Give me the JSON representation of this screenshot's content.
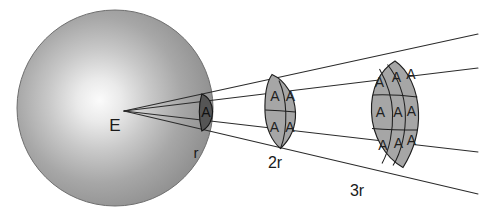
{
  "figure": {
    "background_color": "#ffffff",
    "line_color": "#2b2b2b"
  },
  "sphere": {
    "name": "energy-source-sphere",
    "label": "E",
    "center_x": 115,
    "center_y": 108,
    "radius": 98,
    "fill_center_color": "#f2f2f2",
    "fill_edge_color": "#8f8f8f",
    "outline_color": "#6e6e6e"
  },
  "apex": {
    "x": 124,
    "y": 111
  },
  "patches": [
    {
      "name": "patch-r",
      "distance_label": "r",
      "distance_label_x": 196,
      "distance_label_y": 158,
      "columns": 1,
      "rows": 1,
      "cell_label": "A",
      "cell_count": 1,
      "fill_color": "#5c5c5c",
      "stroke_color": "#1f1f1f",
      "label_color": "#111111"
    },
    {
      "name": "patch-2r",
      "distance_label": "2r",
      "distance_label_x": 275,
      "distance_label_y": 168,
      "columns": 2,
      "rows": 2,
      "cell_label": "A",
      "cell_count": 4,
      "fill_color": "#a6a6a6",
      "stroke_color": "#1f1f1f",
      "label_color": "#1f1f1f"
    },
    {
      "name": "patch-3r",
      "distance_label": "3r",
      "distance_label_x": 357,
      "distance_label_y": 196,
      "columns": 3,
      "rows": 3,
      "cell_label": "A",
      "cell_count": 9,
      "fill_color": "#a6a6a6",
      "stroke_color": "#1f1f1f",
      "label_color": "#1f1f1f"
    }
  ],
  "rays": [
    {
      "name": "ray-top-outer",
      "end_x": 478,
      "end_y": 34
    },
    {
      "name": "ray-top-inner",
      "end_x": 478,
      "end_y": 68
    },
    {
      "name": "ray-bottom-inner",
      "end_x": 478,
      "end_y": 152
    },
    {
      "name": "ray-bottom-outer",
      "end_x": 478,
      "end_y": 194
    }
  ]
}
